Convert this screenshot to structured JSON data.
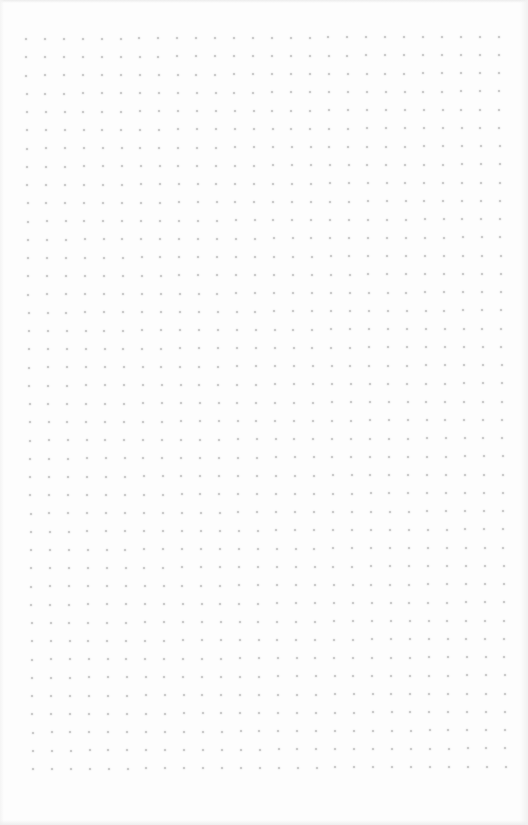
{
  "page": {
    "type": "dot-grid-paper",
    "background_color": "#fdfdfd",
    "dot_color": "#c2c2c2"
  },
  "grid": {
    "columns": 26,
    "rows": 41,
    "origin_x": 26,
    "origin_y": 39,
    "spacing_x": 18.9,
    "spacing_y": 18.25,
    "skew_x_per_row": 0.175,
    "skew_y_per_col": -0.1,
    "dot_size": 2
  }
}
